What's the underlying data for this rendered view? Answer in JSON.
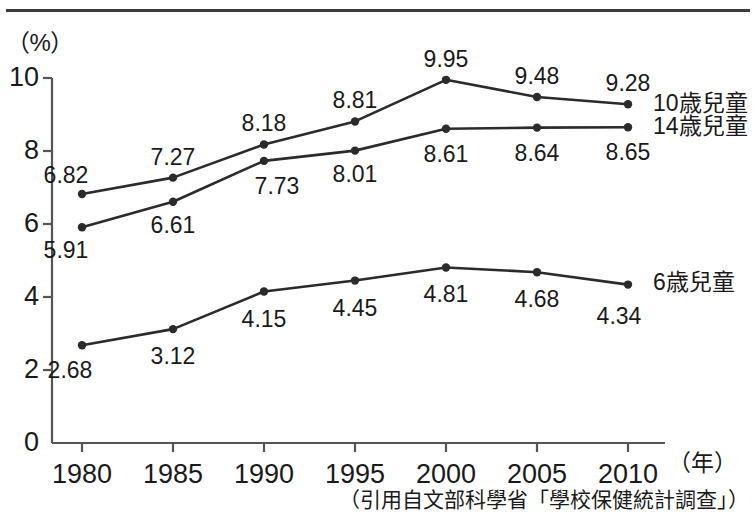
{
  "chart_data": {
    "type": "line",
    "title": "",
    "subtitle": "",
    "xlabel": "",
    "ylabel": "",
    "x_unit": "（年）",
    "y_unit": "（%）",
    "categories": [
      "1980",
      "1985",
      "1990",
      "1995",
      "2000",
      "2005",
      "2010"
    ],
    "x_tick_labels": [
      "1980",
      "1985",
      "1990",
      "1995",
      "2000",
      "2005",
      "2010"
    ],
    "y_tick_labels": [
      "0",
      "2",
      "4",
      "6",
      "8",
      "10"
    ],
    "y_ticks": [
      0,
      2,
      4,
      6,
      8,
      10
    ],
    "ylim": [
      0,
      10.55
    ],
    "grid": false,
    "legend_position": "right-of-line-ends",
    "marker": "filled-circle",
    "line_color": "#2b2b2b",
    "axis_color": "#555555",
    "series": [
      {
        "name": "10歳兒童",
        "values": [
          6.82,
          7.27,
          8.18,
          8.81,
          9.95,
          9.48,
          9.28
        ],
        "label_positions": [
          "above",
          "above",
          "above",
          "above",
          "above",
          "above",
          "above"
        ]
      },
      {
        "name": "14歳兒童",
        "values": [
          5.91,
          6.61,
          7.73,
          8.01,
          8.61,
          8.64,
          8.65
        ],
        "label_positions": [
          "below",
          "below",
          "below",
          "below",
          "below",
          "below",
          "below"
        ]
      },
      {
        "name": "6歳兒童",
        "values": [
          2.68,
          3.12,
          4.15,
          4.45,
          4.81,
          4.68,
          4.34
        ],
        "label_positions": [
          "below",
          "below",
          "below",
          "below",
          "below",
          "below",
          "below"
        ]
      }
    ],
    "annotations": []
  },
  "caption": {
    "source": "（引用自文部科學省「學校保健統計調查」）"
  }
}
